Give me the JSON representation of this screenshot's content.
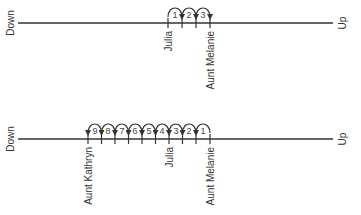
{
  "diagram_top": {
    "left_label": "Down",
    "right_label": "Up",
    "hop_numbers": [
      "1",
      "2",
      "3"
    ],
    "hop_direction": "up",
    "start_label": "Julia",
    "end_label": "Aunt Melanie"
  },
  "diagram_bottom": {
    "left_label": "Down",
    "right_label": "Up",
    "hop_numbers": [
      "9",
      "8",
      "7",
      "6",
      "5",
      "4",
      "3",
      "2",
      "1"
    ],
    "hop_direction": "down",
    "labels": {
      "start": "Aunt Melanie",
      "middle": "Julia",
      "end": "Aunt Kathryn"
    }
  }
}
